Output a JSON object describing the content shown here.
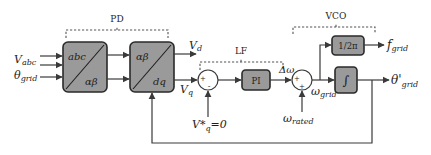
{
  "groups": {
    "pd": "PD",
    "lf": "LF",
    "vco": "VCO"
  },
  "inputs": {
    "v_main": "V",
    "v_sub": "abc",
    "theta_main": "θ",
    "theta_sub": "grid"
  },
  "blocks": {
    "clarke": {
      "top": "abc",
      "bottom": "αβ"
    },
    "park": {
      "top": "αβ",
      "bottom": "dq"
    },
    "pi": "PI",
    "gain": "1/2π",
    "integrator": "∫"
  },
  "signals": {
    "vd_main": "V",
    "vd_sub": "d",
    "vq_main": "V",
    "vq_sub": "q",
    "vq_ref_main": "V*",
    "vq_ref_sub": "q",
    "vq_ref_value": "=0",
    "delta_omega": "Δω",
    "omega_grid_main": "ω",
    "omega_grid_sub": "grid",
    "omega_rated_main": "ω",
    "omega_rated_sub": "rated",
    "f_grid_main": "f",
    "f_grid_sub": "grid",
    "theta_out_main": "θ'",
    "theta_out_sub": "grid"
  },
  "junctions": {
    "sum1": {
      "sign_top": "+",
      "sign_bottom": "-"
    },
    "sum2": {
      "sign_top": "+",
      "sign_bottom": "+"
    }
  },
  "colors": {
    "block_fill": "#9a9a9a",
    "line": "#3a3a3a"
  }
}
